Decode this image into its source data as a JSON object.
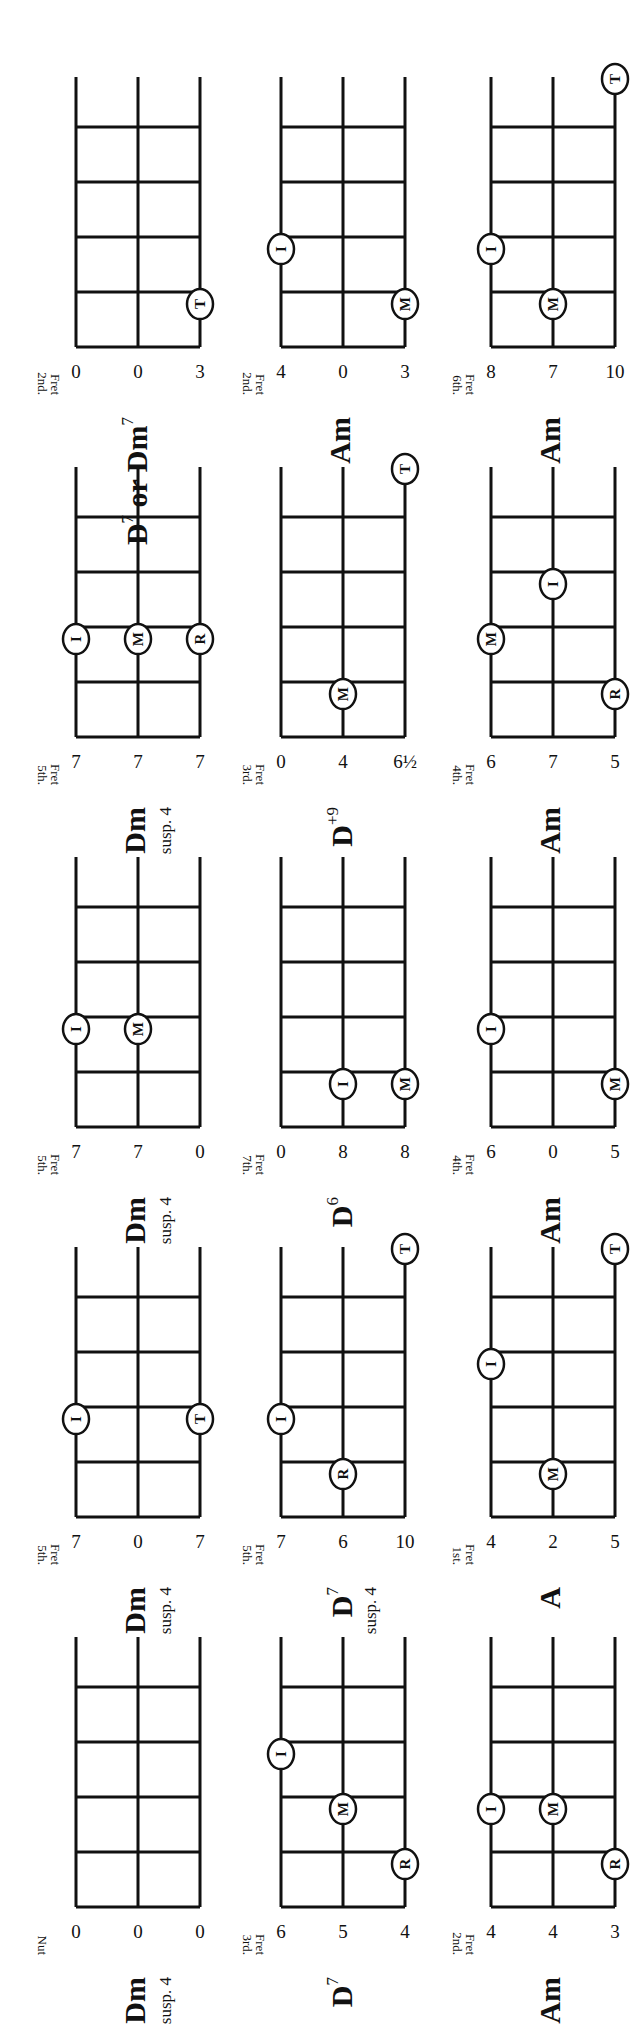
{
  "page": {
    "orientation": "rotated-90-ccw",
    "legend_fingers": {
      "I": "index",
      "M": "middle",
      "R": "ring",
      "T": "thumb"
    }
  },
  "chords": [
    {
      "row": 0,
      "col": 0,
      "name": "Dm",
      "sup": "",
      "sub": "susp. 4",
      "position_label": [
        "",
        "Nut"
      ],
      "strings": [
        "0",
        "0",
        "0"
      ],
      "markers": []
    },
    {
      "row": 0,
      "col": 1,
      "name": "Dm",
      "sup": "",
      "sub": "susp. 4",
      "position_label": [
        "5th.",
        "Fret"
      ],
      "strings": [
        "7",
        "0",
        "7"
      ],
      "markers": [
        {
          "string": 0,
          "fret": 3,
          "finger": "I"
        },
        {
          "string": 2,
          "fret": 3,
          "finger": "T"
        }
      ]
    },
    {
      "row": 0,
      "col": 2,
      "name": "Dm",
      "sup": "",
      "sub": "susp. 4",
      "position_label": [
        "5th.",
        "Fret"
      ],
      "strings": [
        "7",
        "7",
        "0"
      ],
      "markers": [
        {
          "string": 0,
          "fret": 3,
          "finger": "I"
        },
        {
          "string": 1,
          "fret": 3,
          "finger": "M"
        }
      ]
    },
    {
      "row": 0,
      "col": 3,
      "name": "Dm",
      "sup": "",
      "sub": "susp. 4",
      "position_label": [
        "5th.",
        "Fret"
      ],
      "strings": [
        "7",
        "7",
        "7"
      ],
      "markers": [
        {
          "string": 0,
          "fret": 3,
          "finger": "I"
        },
        {
          "string": 1,
          "fret": 3,
          "finger": "M"
        },
        {
          "string": 2,
          "fret": 3,
          "finger": "R"
        }
      ]
    },
    {
      "row": 0,
      "col": 4,
      "name": "D",
      "sup": "7",
      "sub": "",
      "name2": "or Dm",
      "sup2": "7",
      "position_label": [
        "2nd.",
        "Fret"
      ],
      "strings": [
        "0",
        "0",
        "3"
      ],
      "markers": [
        {
          "string": 2,
          "fret": 2,
          "finger": "T"
        }
      ]
    },
    {
      "row": 1,
      "col": 0,
      "name": "D",
      "sup": "7",
      "sub": "",
      "position_label": [
        "3rd.",
        "Fret"
      ],
      "strings": [
        "6",
        "5",
        "4"
      ],
      "markers": [
        {
          "string": 2,
          "fret": 2,
          "finger": "R"
        },
        {
          "string": 1,
          "fret": 3,
          "finger": "M"
        },
        {
          "string": 0,
          "fret": 4,
          "finger": "I"
        }
      ]
    },
    {
      "row": 1,
      "col": 1,
      "name": "D",
      "sup": "7",
      "sub": "susp. 4",
      "position_label": [
        "5th.",
        "Fret"
      ],
      "strings": [
        "7",
        "6",
        "10"
      ],
      "markers": [
        {
          "string": 1,
          "fret": 2,
          "finger": "R"
        },
        {
          "string": 0,
          "fret": 3,
          "finger": "I"
        },
        {
          "string": 2,
          "fret": 5,
          "finger": "T"
        }
      ]
    },
    {
      "row": 1,
      "col": 2,
      "name": "D",
      "sup": "6",
      "sub": "",
      "position_label": [
        "7th.",
        "Fret"
      ],
      "strings": [
        "0",
        "8",
        "8"
      ],
      "markers": [
        {
          "string": 1,
          "fret": 2,
          "finger": "I"
        },
        {
          "string": 2,
          "fret": 2,
          "finger": "M"
        }
      ]
    },
    {
      "row": 1,
      "col": 3,
      "name": "D",
      "sup": "+9",
      "sub": "",
      "position_label": [
        "3rd.",
        "Fret"
      ],
      "strings": [
        "0",
        "4",
        "6½"
      ],
      "markers": [
        {
          "string": 1,
          "fret": 2,
          "finger": "M"
        },
        {
          "string": 2,
          "fret": 5,
          "finger": "T"
        }
      ]
    },
    {
      "row": 1,
      "col": 4,
      "name": "Am",
      "sup": "",
      "sub": "",
      "position_label": [
        "2nd.",
        "Fret"
      ],
      "strings": [
        "4",
        "0",
        "3"
      ],
      "markers": [
        {
          "string": 2,
          "fret": 2,
          "finger": "M"
        },
        {
          "string": 0,
          "fret": 3,
          "finger": "I"
        }
      ]
    },
    {
      "row": 2,
      "col": 0,
      "name": "Am",
      "sup": "",
      "sub": "",
      "position_label": [
        "2nd.",
        "Fret"
      ],
      "strings": [
        "4",
        "4",
        "3"
      ],
      "markers": [
        {
          "string": 2,
          "fret": 2,
          "finger": "R"
        },
        {
          "string": 0,
          "fret": 3,
          "finger": "I"
        },
        {
          "string": 1,
          "fret": 3,
          "finger": "M"
        }
      ]
    },
    {
      "row": 2,
      "col": 1,
      "name": "A",
      "sup": "",
      "sub": "",
      "position_label": [
        "1st.",
        "Fret"
      ],
      "strings": [
        "4",
        "2",
        "5"
      ],
      "markers": [
        {
          "string": 1,
          "fret": 2,
          "finger": "M"
        },
        {
          "string": 0,
          "fret": 4,
          "finger": "I"
        },
        {
          "string": 2,
          "fret": 5,
          "finger": "T"
        }
      ]
    },
    {
      "row": 2,
      "col": 2,
      "name": "Am",
      "sup": "",
      "sub": "",
      "position_label": [
        "4th.",
        "Fret"
      ],
      "strings": [
        "6",
        "0",
        "5"
      ],
      "markers": [
        {
          "string": 2,
          "fret": 2,
          "finger": "M"
        },
        {
          "string": 0,
          "fret": 3,
          "finger": "I"
        }
      ]
    },
    {
      "row": 2,
      "col": 3,
      "name": "Am",
      "sup": "",
      "sub": "",
      "position_label": [
        "4th.",
        "Fret"
      ],
      "strings": [
        "6",
        "7",
        "5"
      ],
      "markers": [
        {
          "string": 2,
          "fret": 2,
          "finger": "R"
        },
        {
          "string": 0,
          "fret": 3,
          "finger": "M"
        },
        {
          "string": 1,
          "fret": 4,
          "finger": "I"
        }
      ]
    },
    {
      "row": 2,
      "col": 4,
      "name": "Am",
      "sup": "",
      "sub": "",
      "position_label": [
        "6th.",
        "Fret"
      ],
      "strings": [
        "8",
        "7",
        "10"
      ],
      "markers": [
        {
          "string": 1,
          "fret": 2,
          "finger": "M"
        },
        {
          "string": 0,
          "fret": 3,
          "finger": "I"
        },
        {
          "string": 2,
          "fret": 5,
          "finger": "T"
        }
      ]
    }
  ]
}
